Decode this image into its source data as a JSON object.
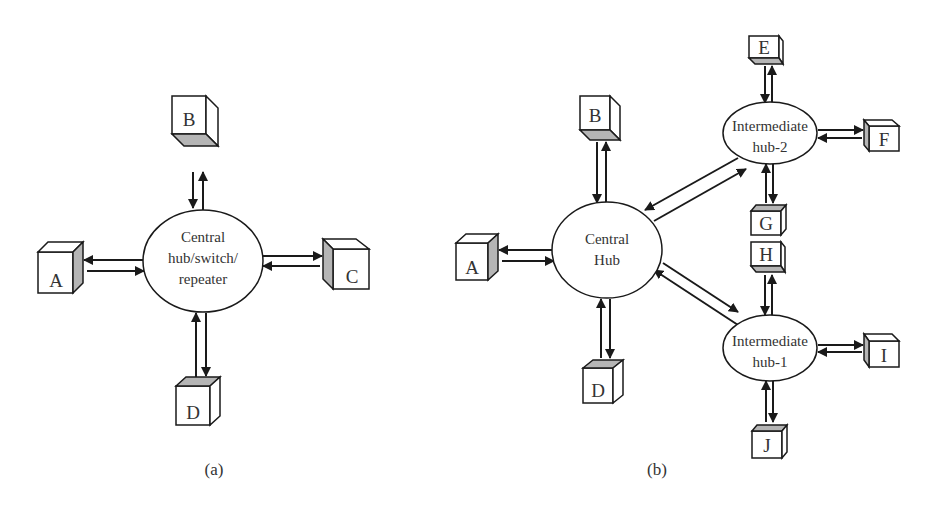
{
  "diagrams": {
    "a": {
      "caption": "(a)",
      "hub": {
        "lines": [
          "Central",
          "hub/switch/",
          "repeater"
        ]
      },
      "nodes": {
        "A": "A",
        "B": "B",
        "C": "C",
        "D": "D"
      }
    },
    "b": {
      "caption": "(b)",
      "central_hub": {
        "lines": [
          "Central",
          "Hub"
        ]
      },
      "hub2": {
        "lines": [
          "Intermediate",
          "hub-2"
        ]
      },
      "hub1": {
        "lines": [
          "Intermediate",
          "hub-1"
        ]
      },
      "nodes": {
        "A": "A",
        "B": "B",
        "D": "D",
        "E": "E",
        "F": "F",
        "G": "G",
        "H": "H",
        "I": "I",
        "J": "J"
      }
    }
  },
  "colors": {
    "line": "#1a1a1a",
    "shade": "#b5b5b5",
    "text": "#333333",
    "background": "#ffffff"
  }
}
